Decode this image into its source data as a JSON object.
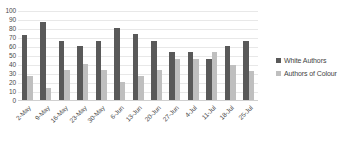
{
  "chart_data": {
    "type": "bar",
    "title": "",
    "subtitle": "",
    "xlabel": "",
    "ylabel": "",
    "ylim": [
      0,
      100
    ],
    "ytick_step": 10,
    "yticks": [
      100,
      90,
      80,
      70,
      60,
      50,
      40,
      30,
      20,
      10,
      0
    ],
    "grid": true,
    "grid_axis": "y",
    "legend_position": "right",
    "categories": [
      "2-May",
      "9-May",
      "16-May",
      "23-May",
      "30-May",
      "6-Jun",
      "13-Jun",
      "20-Jun",
      "27-Jun",
      "4-Jul",
      "11-Jul",
      "18-Jul",
      "25-Jul"
    ],
    "series": [
      {
        "name": "White Authors",
        "color": "#595959",
        "values": [
          72,
          87,
          66,
          60,
          66,
          80,
          73,
          66,
          53,
          53,
          46,
          60,
          66
        ]
      },
      {
        "name": "Authors of Colour",
        "color": "#bfbfbf",
        "values": [
          27,
          13,
          33,
          40,
          33,
          20,
          27,
          33,
          46,
          46,
          53,
          39,
          32
        ]
      }
    ]
  },
  "legend": {
    "items": [
      {
        "label": "White Authors",
        "color": "#595959"
      },
      {
        "label": "Authors of Colour",
        "color": "#bfbfbf"
      }
    ]
  },
  "colors": {
    "series_dark": "#595959",
    "series_light": "#bfbfbf",
    "gridline": "#e8e8e8",
    "text": "#4a4a4a",
    "background": "#ffffff"
  }
}
